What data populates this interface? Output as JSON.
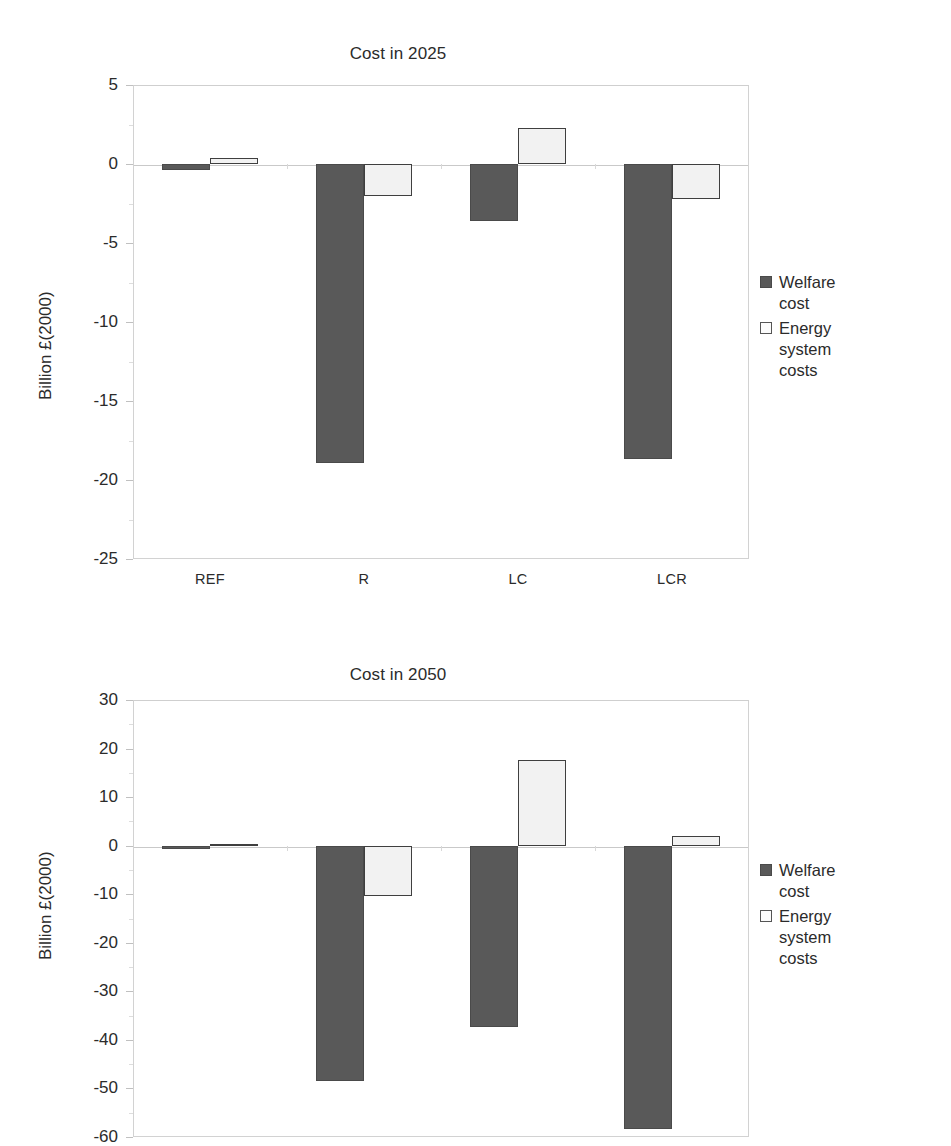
{
  "chart_data": [
    {
      "type": "bar",
      "id": "cost-2025",
      "title": "Cost in 2025",
      "xlabel": "",
      "ylabel": "Billion £(2000)",
      "categories": [
        "REF",
        "R",
        "LC",
        "LCR"
      ],
      "ylim": [
        -25,
        5
      ],
      "yticks": [
        5,
        0,
        -5,
        -10,
        -15,
        -20,
        -25
      ],
      "ytick_labels": [
        "5",
        "0",
        "-5",
        "-10",
        "-15",
        "-20",
        "-25"
      ],
      "grid": false,
      "legend_position": "right",
      "series": [
        {
          "name": "Welfare cost",
          "color": "#595959",
          "values": [
            -0.4,
            -18.9,
            -3.6,
            -18.7
          ]
        },
        {
          "name": "Energy system costs",
          "color": "#f2f2f2",
          "values": [
            0.4,
            -2.0,
            2.3,
            -2.2
          ]
        }
      ]
    },
    {
      "type": "bar",
      "id": "cost-2050",
      "title": "Cost in 2050",
      "xlabel": "",
      "ylabel": "Billion £(2000)",
      "categories": [
        "REF",
        "R",
        "LC",
        "LCR"
      ],
      "ylim": [
        -60,
        30
      ],
      "yticks": [
        30,
        20,
        10,
        0,
        -10,
        -20,
        -30,
        -40,
        -50,
        -60
      ],
      "ytick_labels": [
        "30",
        "20",
        "10",
        "0",
        "-10",
        "-20",
        "-30",
        "-40",
        "-50",
        "-60"
      ],
      "grid": false,
      "legend_position": "right",
      "series": [
        {
          "name": "Welfare cost",
          "color": "#595959",
          "values": [
            -0.6,
            -48.4,
            -37.3,
            -58.3
          ]
        },
        {
          "name": "Energy system costs",
          "color": "#f2f2f2",
          "values": [
            0.3,
            -10.3,
            17.6,
            2.0
          ]
        }
      ]
    }
  ],
  "charts": {
    "top": {
      "title": "Cost in 2025",
      "ylabel": "Billion £(2000)",
      "yticks": [
        "5",
        "0",
        "-5",
        "-10",
        "-15",
        "-20",
        "-25"
      ],
      "xticks": [
        "REF",
        "R",
        "LC",
        "LCR"
      ],
      "legend": [
        {
          "label": "Welfare cost",
          "swatch": "welfare"
        },
        {
          "label": "Energy\nsystem costs",
          "swatch": "energy"
        }
      ]
    },
    "bottom": {
      "title": "Cost in 2050",
      "ylabel": "Billion £(2000)",
      "yticks": [
        "30",
        "20",
        "10",
        "0",
        "-10",
        "-20",
        "-30",
        "-40",
        "-50",
        "-60"
      ],
      "xticks": [
        "REF",
        "R",
        "LC",
        "LCR"
      ],
      "legend": [
        {
          "label": "Welfare cost",
          "swatch": "welfare"
        },
        {
          "label": "Energy\nsystem costs",
          "swatch": "energy"
        }
      ]
    }
  },
  "colors": {
    "welfare": "#595959",
    "energy": "#f2f2f2",
    "axis": "#c9c9c9",
    "text": "#2b2b2b"
  }
}
